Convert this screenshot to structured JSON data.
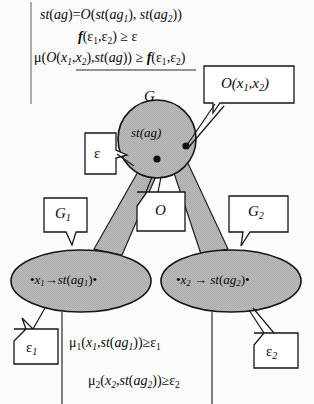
{
  "figure": {
    "title_equations": [
      {
        "id": "eq1",
        "text": "st(ag)=O(st(ag1), st(ag2))"
      },
      {
        "id": "eq2",
        "text": "f(ε1,ε2) ≥ ε"
      },
      {
        "id": "eq3",
        "text": "μ(O(x1,x2),st(ag)) ≥ f(ε1,ε2)"
      }
    ],
    "bottom_equations": [
      {
        "id": "eq4",
        "text": "μ1(x1,st(ag1))≥ε1"
      },
      {
        "id": "eq5",
        "text": "μ2(x2,st(ag2))≥ε2"
      }
    ],
    "nodes": [
      {
        "id": "root",
        "label": "G",
        "content": "st(ag)",
        "shape": "circle"
      },
      {
        "id": "left",
        "label": "G1",
        "content": "•x1→st(ag1)•",
        "shape": "ellipse"
      },
      {
        "id": "right",
        "label": "G2",
        "content": "•x2 → st(ag2)•",
        "shape": "ellipse"
      }
    ],
    "callouts": [
      {
        "id": "callout-o-x1x2",
        "text": "O(x1,x2)"
      },
      {
        "id": "callout-epsilon",
        "text": "ε"
      },
      {
        "id": "callout-g1",
        "text": "G1"
      },
      {
        "id": "callout-o",
        "text": "O"
      },
      {
        "id": "callout-g2",
        "text": "G2"
      },
      {
        "id": "callout-epsilon1",
        "text": "ε1"
      },
      {
        "id": "callout-epsilon2",
        "text": "ε2"
      }
    ],
    "colors": {
      "node_fill": "#b7b7b7",
      "connector_fill": "#b0b0b0",
      "stroke": "#1a1a1a",
      "callout_fill": "#ffffff",
      "background": "#fbfbfb"
    }
  }
}
